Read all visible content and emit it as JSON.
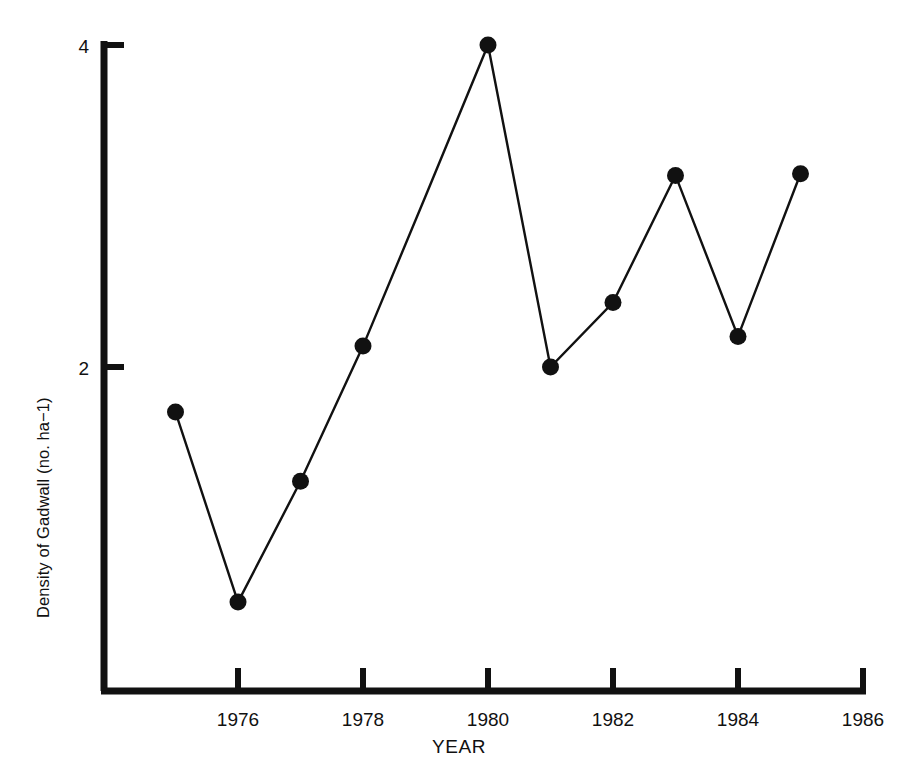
{
  "chart_data": {
    "type": "line",
    "title": "",
    "xlabel": "YEAR",
    "ylabel": "Density of Gadwall (no. ha−1)",
    "ylabel_plain": "Density of Gadwall (no. ha-1)",
    "x": [
      1975,
      1976,
      1977,
      1978,
      1979,
      1980,
      1981,
      1982,
      1983,
      1984,
      1985
    ],
    "values": [
      1.72,
      0.54,
      1.29,
      2.13,
      3.06,
      4.0,
      2.0,
      2.4,
      3.19,
      2.19,
      3.2
    ],
    "series": [
      {
        "name": "Density of Gadwall",
        "values": [
          1.72,
          0.54,
          1.29,
          2.13,
          3.06,
          4.0,
          2.0,
          2.4,
          3.19,
          2.19,
          3.2
        ]
      }
    ],
    "markers": true,
    "marker_shape": "filled-circle",
    "marker_years_shown": [
      1975,
      1976,
      1977,
      1978,
      1980,
      1981,
      1982,
      1983,
      1984,
      1985
    ],
    "xlim": [
      1974,
      1986
    ],
    "ylim": [
      0,
      4.04
    ],
    "xticks": [
      1976,
      1978,
      1980,
      1982,
      1984,
      1986
    ],
    "xtick_labels": [
      "1976",
      "1978",
      "1980",
      "1982",
      "1984",
      "1986"
    ],
    "yticks": [
      2,
      4
    ],
    "ytick_labels": [
      "2",
      "4"
    ],
    "grid": false,
    "legend": "none",
    "line_color": "#111111",
    "marker_color": "#111111",
    "background_color": "#ffffff"
  },
  "axes": {
    "y_tick_top_label": "4",
    "y_tick_mid_label": "2",
    "x_tick_labels": [
      "1976",
      "1978",
      "1980",
      "1982",
      "1984",
      "1986"
    ],
    "x_axis_title": "YEAR",
    "y_axis_title": "Density of Gadwall (no. ha−1)"
  }
}
